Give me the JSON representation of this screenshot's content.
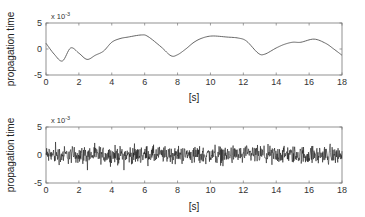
{
  "chart_data": [
    {
      "type": "line",
      "title": "",
      "xlabel": "[s]",
      "ylabel": "propagation time",
      "y_scale_label": "x 10^-3",
      "y_multiplier_exponent": -3,
      "xlim": [
        0,
        18
      ],
      "ylim": [
        -5,
        5
      ],
      "xticks": [
        0,
        2,
        4,
        6,
        8,
        10,
        12,
        14,
        16,
        18
      ],
      "yticks": [
        -5,
        0,
        5
      ],
      "grid": false,
      "series": [
        {
          "name": "propagation time (smooth)",
          "color": "#555555",
          "x": [
            0,
            0.5,
            1.0,
            1.5,
            2.0,
            2.5,
            3.0,
            3.5,
            4.0,
            4.5,
            5.0,
            5.8,
            6.2,
            7.0,
            7.6,
            8.0,
            8.5,
            9.0,
            9.5,
            10.1,
            11.0,
            11.7,
            12.2,
            12.9,
            13.3,
            14.0,
            14.5,
            15.0,
            15.5,
            16.3,
            17.0,
            17.5,
            18.0
          ],
          "values": [
            1.1,
            -1.0,
            -2.3,
            0.2,
            -0.8,
            -2.0,
            -1.2,
            -0.4,
            1.3,
            2.0,
            2.3,
            2.7,
            2.4,
            0.4,
            -1.3,
            -1.1,
            0.0,
            1.3,
            2.1,
            2.5,
            2.3,
            2.1,
            1.5,
            -0.8,
            -1.0,
            0.2,
            0.9,
            1.3,
            1.3,
            1.9,
            1.1,
            0.0,
            -1.2
          ]
        }
      ]
    },
    {
      "type": "line",
      "title": "",
      "xlabel": "[s]",
      "ylabel": "propagation time",
      "y_scale_label": "x 10^-3",
      "y_multiplier_exponent": -3,
      "xlim": [
        0,
        18
      ],
      "ylim": [
        -5,
        5
      ],
      "xticks": [
        0,
        2,
        4,
        6,
        8,
        10,
        12,
        14,
        16,
        18
      ],
      "yticks": [
        -5,
        0,
        5
      ],
      "grid": false,
      "series": [
        {
          "name": "propagation time (noisy)",
          "color": "#111111",
          "description": "dense high-frequency noise centered at 0, amplitude mostly within ±1.5, peaks to about ±2.7",
          "mean": 0,
          "amplitude_typical": 1.2,
          "amplitude_max": 2.7,
          "samples": 900
        }
      ]
    }
  ],
  "labels": {
    "ylabel": "propagation time",
    "xlabel": "[s]",
    "exponent_prefix": "x 10",
    "exponent": "-3"
  }
}
